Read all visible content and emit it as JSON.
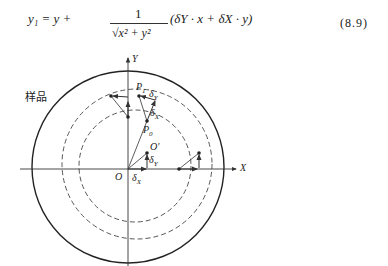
{
  "equation": {
    "lhs": "y₁ = y +",
    "numerator": "1",
    "denominator": "√x² + y²",
    "rhs": "(δY · x + δX · y)",
    "number": "(8.9)"
  },
  "figure": {
    "sample_label": "样品",
    "axis_x": "X",
    "axis_y": "Y",
    "origin": "O",
    "shifted_origin": "O′",
    "p1": "P",
    "p1_sub": "1",
    "p0": "P",
    "p0_sub": "0",
    "delta_x_sym": "δ",
    "delta_x_sub": "X",
    "delta_y_sym": "δ",
    "delta_y_sub": "Y",
    "colors": {
      "line": "#333333",
      "outer_circle": "#222222"
    }
  }
}
